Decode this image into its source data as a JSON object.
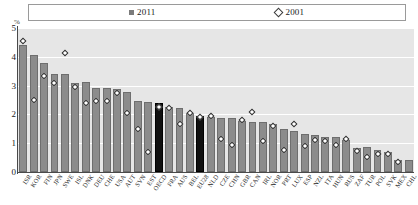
{
  "legend": {
    "series": [
      {
        "label": "2011",
        "marker": "filled-square",
        "color": "#7b7b7b"
      },
      {
        "label": "2001",
        "marker": "open-diamond",
        "color": "#ffffff"
      }
    ]
  },
  "axis": {
    "unit_label": "%",
    "yticks": [
      "0",
      "1",
      "2",
      "3",
      "4",
      "5"
    ],
    "ymin": 0,
    "ymax": 5
  },
  "style": {
    "bar_color": "#8c8c8c",
    "highlight_color": "#101010",
    "plot_background": "#e6e6e6",
    "gridline_color": "#ffffff"
  },
  "chart_data": {
    "type": "bar",
    "title": "",
    "xlabel": "",
    "ylabel": "%",
    "ylim": [
      0,
      5
    ],
    "grid": true,
    "legend_position": "top",
    "highlight_categories": [
      "OECD",
      "EU28"
    ],
    "categories": [
      "ISR",
      "KOR",
      "FIN",
      "JPN",
      "SWE",
      "ISL",
      "DNK",
      "DEU",
      "CHE",
      "USA",
      "AUT",
      "SVN",
      "EST",
      "OECD",
      "FRA",
      "AUS",
      "BEL",
      "EU28",
      "NLD",
      "CZE",
      "CHN",
      "GBR",
      "CAN",
      "IRL",
      "NOR",
      "PRT",
      "LUX",
      "ESP",
      "NZL",
      "ITA",
      "HUN",
      "RUS",
      "ZAF",
      "TUR",
      "POL",
      "SVK",
      "MEX",
      "CHL"
    ],
    "series": [
      {
        "name": "2011",
        "marker": "bar",
        "values": [
          4.4,
          4.05,
          3.8,
          3.42,
          3.4,
          3.08,
          3.11,
          2.9,
          2.9,
          2.87,
          2.77,
          2.48,
          2.42,
          2.38,
          2.25,
          2.22,
          2.04,
          1.94,
          1.9,
          1.87,
          1.86,
          1.78,
          1.74,
          1.72,
          1.65,
          1.5,
          1.43,
          1.33,
          1.27,
          1.22,
          1.2,
          1.1,
          0.83,
          0.86,
          0.76,
          0.68,
          0.43,
          0.42
        ]
      },
      {
        "name": "2001",
        "marker": "diamond",
        "values": [
          4.55,
          2.5,
          3.34,
          3.09,
          4.13,
          2.95,
          2.41,
          2.48,
          2.48,
          2.73,
          2.05,
          1.51,
          0.69,
          2.26,
          2.21,
          1.67,
          2.06,
          1.92,
          1.94,
          1.15,
          0.95,
          1.79,
          2.09,
          1.09,
          1.61,
          0.78,
          1.65,
          0.91,
          1.11,
          1.08,
          0.94,
          1.15,
          0.74,
          0.51,
          0.62,
          0.63,
          0.35,
          null
        ]
      }
    ]
  }
}
